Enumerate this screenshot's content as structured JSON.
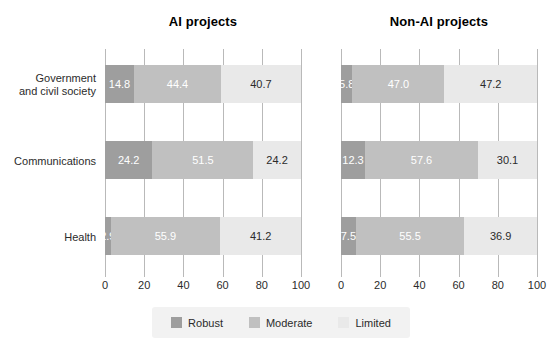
{
  "chart_data": {
    "type": "bar",
    "subtype": "stacked-horizontal-100pct",
    "title": "",
    "xlabel": "",
    "ylabel": "",
    "xlim": [
      0,
      100
    ],
    "xticks": [
      0,
      20,
      40,
      60,
      80,
      100
    ],
    "xtick_labels": [
      "0",
      "20",
      "40",
      "60",
      "80",
      "100"
    ],
    "grid": true,
    "grid_orientation": "vertical",
    "legend_position": "bottom-center",
    "categories": [
      "Government and civil society",
      "Communications",
      "Health"
    ],
    "series": [
      {
        "name": "Robust",
        "color": "#9e9e9e"
      },
      {
        "name": "Moderate",
        "color": "#c0c0c0"
      },
      {
        "name": "Limited",
        "color": "#e9e9e9"
      }
    ],
    "panels": [
      {
        "title": "AI projects",
        "rows": [
          {
            "category": "Government and civil society",
            "values": [
              14.8,
              44.4,
              40.7
            ],
            "labels": [
              "14.8",
              "44.4",
              "40.7"
            ]
          },
          {
            "category": "Communications",
            "values": [
              24.2,
              51.5,
              24.2
            ],
            "labels": [
              "24.2",
              "51.5",
              "24.2"
            ]
          },
          {
            "category": "Health",
            "values": [
              2.9,
              55.9,
              41.2
            ],
            "labels": [
              "2.9",
              "55.9",
              "41.2"
            ]
          }
        ]
      },
      {
        "title": "Non-AI projects",
        "rows": [
          {
            "category": "Government and civil society",
            "values": [
              5.8,
              47.0,
              47.2
            ],
            "labels": [
              "5.8",
              "47.0",
              "47.2"
            ]
          },
          {
            "category": "Communications",
            "values": [
              12.3,
              57.6,
              30.1
            ],
            "labels": [
              "12.3",
              "57.6",
              "30.1"
            ]
          },
          {
            "category": "Health",
            "values": [
              7.5,
              55.5,
              36.9
            ],
            "labels": [
              "7.5",
              "55.5",
              "36.9"
            ]
          }
        ]
      }
    ]
  },
  "panel_titles": {
    "left": "AI projects",
    "right": "Non-AI projects"
  },
  "category_labels": [
    {
      "line1": "Government",
      "line2": "and civil society"
    },
    {
      "line1": "Communications",
      "line2": ""
    },
    {
      "line1": "Health",
      "line2": ""
    }
  ],
  "axis": {
    "tick_labels": [
      "0",
      "20",
      "40",
      "60",
      "80",
      "100"
    ]
  },
  "legend": {
    "items": [
      {
        "label": "Robust",
        "color": "#9e9e9e"
      },
      {
        "label": "Moderate",
        "color": "#c0c0c0"
      },
      {
        "label": "Limited",
        "color": "#e9e9e9"
      }
    ]
  },
  "colors": {
    "robust": "#9e9e9e",
    "moderate": "#c0c0c0",
    "limited": "#e9e9e9",
    "gridline": "#b9b9b9",
    "text": "#2b2b2b",
    "legend_background": "#f2f2f2",
    "background": "#ffffff"
  }
}
